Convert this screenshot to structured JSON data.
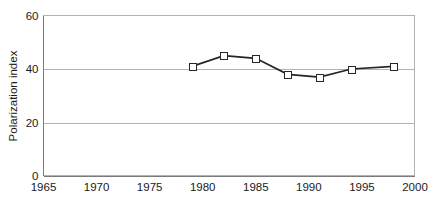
{
  "chart_data": {
    "type": "line",
    "title": "",
    "xlabel": "",
    "ylabel": "Polarization index",
    "xlim": [
      1965,
      2000
    ],
    "ylim": [
      0,
      60
    ],
    "xticks": [
      1965,
      1970,
      1975,
      1980,
      1985,
      1990,
      1995,
      2000
    ],
    "xtick_labels": [
      "1965",
      "1970",
      "1975",
      "1980",
      "1985",
      "1990",
      "1995",
      "2000"
    ],
    "yticks": [
      0,
      20,
      40,
      60
    ],
    "ytick_labels": [
      "0",
      "20",
      "40",
      "60"
    ],
    "grid": "horizontal",
    "legend": "none",
    "series": [
      {
        "name": "Polarization index",
        "marker": "open-square",
        "line_color": "#262626",
        "marker_fill": "#ffffff",
        "marker_edge_color": "#262626",
        "x": [
          1979,
          1982,
          1985,
          1988,
          1991,
          1994,
          1998
        ],
        "values": [
          41,
          45,
          44,
          38,
          37,
          40,
          41
        ]
      }
    ]
  },
  "style": {
    "background": "#ffffff",
    "grid_color": "#b3b3b3",
    "axis_color": "#7a7a7a",
    "text_color": "#1a1a1a"
  }
}
